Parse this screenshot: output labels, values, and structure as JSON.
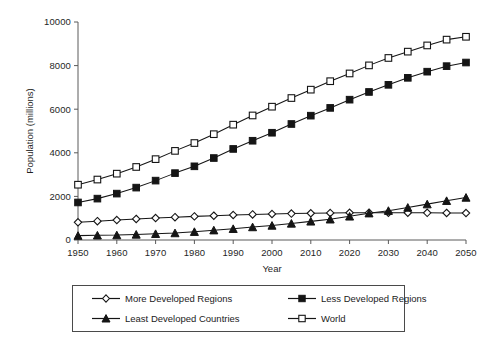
{
  "chart_data": {
    "type": "line",
    "title": "",
    "xlabel": "Year",
    "ylabel": "Population (millions)",
    "xlim": [
      1950,
      2050
    ],
    "ylim": [
      0,
      10000
    ],
    "grid": false,
    "legend_position": "bottom",
    "x": [
      1950,
      1955,
      1960,
      1965,
      1970,
      1975,
      1980,
      1985,
      1990,
      1995,
      2000,
      2005,
      2010,
      2015,
      2020,
      2025,
      2030,
      2035,
      2040,
      2045,
      2050
    ],
    "xticks": [
      1950,
      1960,
      1970,
      1980,
      1990,
      2000,
      2010,
      2020,
      2030,
      2040,
      2050
    ],
    "xtick_labels": [
      "1950",
      "1960",
      "1970",
      "1980",
      "1990",
      "2000",
      "2010",
      "2020",
      "2030",
      "2040",
      "2050"
    ],
    "yticks": [
      0,
      2000,
      4000,
      6000,
      8000,
      10000
    ],
    "ytick_labels": [
      "0",
      "2000",
      "4000",
      "6000",
      "8000",
      "10000"
    ],
    "series": [
      {
        "name": "More Developed Regions",
        "marker": "open-diamond",
        "values": [
          813,
          864,
          915,
          966,
          1008,
          1047,
          1083,
          1115,
          1148,
          1174,
          1194,
          1211,
          1227,
          1240,
          1249,
          1253,
          1253,
          1250,
          1246,
          1241,
          1236
        ]
      },
      {
        "name": "Less Developed Regions",
        "marker": "filled-square",
        "values": [
          1722,
          1898,
          2128,
          2403,
          2724,
          3068,
          3380,
          3760,
          4177,
          4553,
          4920,
          5321,
          5703,
          6060,
          6437,
          6791,
          7118,
          7439,
          7721,
          7975,
          8141
        ]
      },
      {
        "name": "Least Developed Countries",
        "marker": "filled-triangle",
        "values": [
          200,
          215,
          225,
          255,
          285,
          320,
          380,
          450,
          515,
          595,
          665,
          760,
          855,
          950,
          1085,
          1230,
          1345,
          1490,
          1645,
          1800,
          1950
        ]
      },
      {
        "name": "World",
        "marker": "open-square",
        "values": [
          2536,
          2773,
          3043,
          3350,
          3709,
          4088,
          4448,
          4854,
          5290,
          5713,
          6115,
          6512,
          6896,
          7284,
          7640,
          8010,
          8350,
          8640,
          8925,
          9191,
          9322
        ]
      }
    ]
  },
  "legend": {
    "items": [
      {
        "label": "More Developed Regions",
        "marker": "open-diamond"
      },
      {
        "label": "Less Developed Regions",
        "marker": "filled-square"
      },
      {
        "label": "Least Developed Countries",
        "marker": "filled-triangle"
      },
      {
        "label": "World",
        "marker": "open-square"
      }
    ]
  },
  "colors": {
    "line": "#151515",
    "axis": "#5a5a5a",
    "text": "#1b1b1b",
    "background": "#ffffff",
    "marker_fill_open": "#ffffff"
  }
}
